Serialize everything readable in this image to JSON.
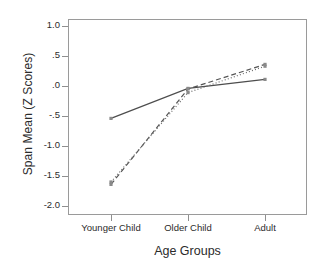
{
  "chart_data": {
    "type": "line",
    "title": "",
    "xlabel": "Age Groups",
    "ylabel": "Span Mean (Z Scores)",
    "categories": [
      "Younger Child",
      "Older Child",
      "Adult"
    ],
    "ylim": [
      -2.0,
      1.0
    ],
    "yticks": [
      1.0,
      0.5,
      0.0,
      -0.5,
      -1.0,
      -1.5,
      -2.0
    ],
    "ytick_labels": [
      "1.0",
      ".5",
      ".0",
      "-.5",
      "-1.0",
      "-1.5",
      "-2.0"
    ],
    "grid": false,
    "legend": "none",
    "series": [
      {
        "name": "solid-line",
        "style": "solid",
        "color": "#4d4d4d",
        "values": [
          -0.54,
          -0.04,
          0.11
        ]
      },
      {
        "name": "dashed-line",
        "style": "dashed",
        "color": "#555555",
        "values": [
          -1.64,
          -0.05,
          0.36
        ]
      },
      {
        "name": "dotted-line",
        "style": "dotted",
        "color": "#6b6b6b",
        "values": [
          -1.6,
          -0.11,
          0.33
        ]
      }
    ]
  },
  "axes": {
    "frame_color": "#9a9a9a",
    "tick_color": "#8f8f8f",
    "text_color": "#2b2b2b"
  }
}
